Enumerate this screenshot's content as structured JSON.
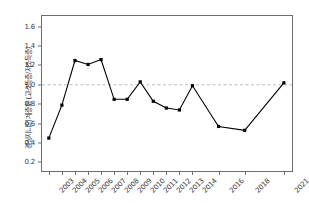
{
  "chart_data": {
    "type": "line",
    "title": "",
    "xlabel": "",
    "ylabel": "경상지니의 계층화 (고소득층/저소득층)",
    "categories": [
      "2003",
      "2004",
      "2005",
      "2006",
      "2007",
      "2008",
      "2009",
      "2010",
      "2011",
      "2012",
      "2013",
      "2014",
      "2016",
      "2018",
      "2021"
    ],
    "x": [
      2003,
      2004,
      2005,
      2006,
      2007,
      2008,
      2009,
      2010,
      2011,
      2012,
      2013,
      2014,
      2016,
      2018,
      2021
    ],
    "values": [
      0.45,
      0.79,
      1.25,
      1.21,
      1.26,
      0.85,
      0.85,
      1.03,
      0.83,
      0.76,
      0.74,
      0.99,
      0.57,
      0.53,
      1.02
    ],
    "series": [
      {
        "name": "고소득층/저소득층",
        "values": [
          0.45,
          0.79,
          1.25,
          1.21,
          1.26,
          0.85,
          0.85,
          1.03,
          0.83,
          0.76,
          0.74,
          0.99,
          0.57,
          0.53,
          1.02
        ]
      }
    ],
    "ylim": [
      0.1,
      1.72
    ],
    "xlim": [
      2002.4,
      2021.7
    ],
    "yticks": [
      0.2,
      0.4,
      0.6,
      0.8,
      1.0,
      1.2,
      1.4,
      1.6
    ],
    "ytick_labels": [
      "0.2",
      "0.4",
      "0.6",
      "0.8",
      "1.0",
      "1.2",
      "1.4",
      "1.6"
    ],
    "grid": false,
    "legend": "none",
    "marker": "square",
    "line_color": "#000000",
    "marker_color": "#000000",
    "reference_line": {
      "value": 1.0,
      "style": "dashed",
      "color": "#b4b4c8"
    },
    "annotations": []
  }
}
